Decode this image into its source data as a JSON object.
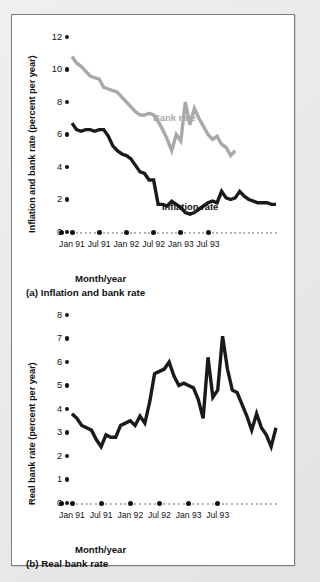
{
  "figure": {
    "background": "#e8e8e8",
    "panel_background": "#ffffff",
    "border_color": "#7e7e7e"
  },
  "colors": {
    "bank_rate": "#a9a9a9",
    "inflation_rate": "#1a1a1a",
    "real_bank_rate": "#1a1a1a",
    "axis": "#111111",
    "axis_dots_minor": "#9a9a9a"
  },
  "chart_data": [
    {
      "id": "chart-a",
      "type": "line",
      "title": "(a) Inflation and bank rate",
      "caption": "(a) Inflation and bank rate",
      "xlabel": "Month/year",
      "ylabel": "Inflation and bank rate (percent per year)",
      "ylim": [
        0,
        12
      ],
      "yticks": [
        0,
        2,
        4,
        6,
        8,
        10,
        12
      ],
      "xlim": [
        "Jan 91",
        "Oct 93"
      ],
      "xticks": [
        "Jan 91",
        "Jul 91",
        "Jan 92",
        "Jul 92",
        "Jan 93",
        "Jul 93"
      ],
      "xtick_index": [
        0,
        6,
        12,
        18,
        24,
        30
      ],
      "grid": false,
      "legend": "inline-annotation",
      "x": [
        "Jan 91",
        "Feb 91",
        "Mar 91",
        "Apr 91",
        "May 91",
        "Jun 91",
        "Jul 91",
        "Aug 91",
        "Sep 91",
        "Oct 91",
        "Nov 91",
        "Dec 91",
        "Jan 92",
        "Feb 92",
        "Mar 92",
        "Apr 92",
        "May 92",
        "Jun 92",
        "Jul 92",
        "Aug 92",
        "Sep 92",
        "Oct 92",
        "Nov 92",
        "Dec 92",
        "Jan 93",
        "Feb 93",
        "Mar 93",
        "Apr 93",
        "May 93",
        "Jun 93",
        "Jul 93",
        "Aug 93",
        "Sep 93",
        "Oct 93"
      ],
      "series": [
        {
          "name": "Bank rate",
          "color": "#a9a9a9",
          "label_text": "Bank rate",
          "values": [
            10.8,
            10.4,
            10.2,
            9.9,
            9.6,
            9.5,
            9.4,
            8.9,
            8.8,
            8.7,
            8.6,
            8.3,
            8.0,
            7.7,
            7.4,
            7.2,
            7.2,
            7.3,
            7.2,
            6.8,
            6.3,
            5.7,
            5.0,
            6.0,
            5.6,
            8.0,
            6.6,
            7.6,
            7.0,
            6.5,
            6.0,
            5.7,
            5.9,
            5.4,
            5.2,
            4.7,
            5.0
          ]
        },
        {
          "name": "Inflation rate",
          "color": "#1a1a1a",
          "label_text": "Inflation rate",
          "values": [
            6.7,
            6.3,
            6.2,
            6.3,
            6.3,
            6.2,
            6.3,
            6.3,
            5.9,
            5.3,
            5.0,
            4.8,
            4.7,
            4.5,
            4.1,
            3.7,
            3.6,
            3.2,
            3.2,
            1.7,
            1.7,
            1.6,
            1.9,
            1.7,
            1.5,
            1.2,
            1.1,
            1.2,
            1.4,
            1.6,
            1.8,
            1.9,
            1.8,
            2.5,
            2.1,
            2.0,
            2.1,
            2.5,
            2.2,
            2.0,
            1.9,
            1.8,
            1.8,
            1.8,
            1.7,
            1.7
          ]
        }
      ]
    },
    {
      "id": "chart-b",
      "type": "line",
      "title": "(b) Real bank rate",
      "caption": "(b) Real bank rate",
      "xlabel": "Month/year",
      "ylabel": "Real bank rate (percent per year)",
      "ylim": [
        0,
        8
      ],
      "yticks": [
        0,
        1,
        2,
        3,
        4,
        5,
        6,
        7,
        8
      ],
      "xlim": [
        "Jan 91",
        "Oct 93"
      ],
      "xticks": [
        "Jan 91",
        "Jul 91",
        "Jan 92",
        "Jul 92",
        "Jan 93",
        "Jul 93"
      ],
      "xtick_index": [
        0,
        6,
        12,
        18,
        24,
        30
      ],
      "grid": false,
      "legend": "none",
      "x": [
        "Jan 91",
        "Feb 91",
        "Mar 91",
        "Apr 91",
        "May 91",
        "Jun 91",
        "Jul 91",
        "Aug 91",
        "Sep 91",
        "Oct 91",
        "Nov 91",
        "Dec 91",
        "Jan 92",
        "Feb 92",
        "Mar 92",
        "Apr 92",
        "May 92",
        "Jun 92",
        "Jul 92",
        "Aug 92",
        "Sep 92",
        "Oct 92",
        "Nov 92",
        "Dec 92",
        "Jan 93",
        "Feb 93",
        "Mar 93",
        "Apr 93",
        "May 93",
        "Jun 93",
        "Jul 93",
        "Aug 93",
        "Sep 93",
        "Oct 93"
      ],
      "series": [
        {
          "name": "Real bank rate",
          "color": "#1a1a1a",
          "values": [
            3.8,
            3.6,
            3.3,
            3.2,
            3.1,
            2.7,
            2.4,
            2.9,
            2.8,
            2.8,
            3.3,
            3.4,
            3.5,
            3.3,
            3.7,
            3.4,
            4.3,
            5.5,
            5.6,
            5.7,
            6.0,
            5.4,
            5.0,
            5.1,
            5.0,
            4.9,
            4.4,
            3.6,
            6.2,
            4.5,
            4.8,
            7.1,
            5.7,
            4.8,
            4.7,
            4.2,
            3.7,
            3.1,
            3.8,
            3.2,
            2.9,
            2.4,
            3.2
          ]
        }
      ]
    }
  ]
}
